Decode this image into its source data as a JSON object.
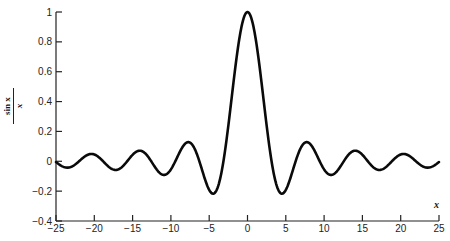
{
  "chart_data": {
    "type": "line",
    "title": "",
    "function": "sin(x)/x",
    "xlabel": "x",
    "ylabel_numerator": "sin x",
    "ylabel_denominator": "x",
    "xlim": [
      -25,
      25
    ],
    "ylim": [
      -0.4,
      1.0
    ],
    "grid": false,
    "legend": null,
    "x_ticks": [
      -25,
      -20,
      -15,
      -10,
      -5,
      0,
      5,
      10,
      15,
      20,
      25
    ],
    "x_tick_labels": [
      "−25",
      "−20",
      "−15",
      "−10",
      "−5",
      "0",
      "5",
      "10",
      "15",
      "20",
      "25"
    ],
    "y_ticks": [
      1,
      0.8,
      0.6,
      0.4,
      0.2,
      0,
      -0.2,
      -0.4
    ],
    "y_tick_labels": [
      "1",
      "0.8",
      "0.6",
      "0.4",
      "0.2",
      "0",
      "−0.2",
      "−0.4"
    ],
    "series": [
      {
        "name": "sin x / x",
        "color": "#0a0a0a",
        "x": [
          -25,
          -24,
          -23,
          -22,
          -21,
          -20,
          -19,
          -18,
          -17,
          -16,
          -15,
          -14,
          -13,
          -12,
          -11,
          -10,
          -9,
          -8,
          -7,
          -6,
          -5,
          -4,
          -3,
          -2,
          -1,
          0,
          1,
          2,
          3,
          4,
          5,
          6,
          7,
          8,
          9,
          10,
          11,
          12,
          13,
          14,
          15,
          16,
          17,
          18,
          19,
          20,
          21,
          22,
          23,
          24,
          25
        ],
        "values": [
          -0.005,
          -0.038,
          -0.037,
          0.0,
          0.04,
          0.046,
          0.008,
          -0.042,
          -0.056,
          -0.018,
          0.043,
          0.071,
          0.032,
          -0.045,
          -0.091,
          -0.054,
          0.046,
          0.124,
          0.094,
          -0.047,
          -0.192,
          -0.189,
          0.047,
          0.455,
          0.841,
          1.0,
          0.841,
          0.455,
          0.047,
          -0.189,
          -0.192,
          -0.047,
          0.094,
          0.124,
          0.046,
          -0.054,
          -0.091,
          -0.045,
          0.032,
          0.071,
          0.043,
          -0.018,
          -0.056,
          -0.042,
          0.008,
          0.046,
          0.04,
          0.0,
          -0.037,
          -0.038,
          -0.005
        ]
      }
    ]
  },
  "axes": {
    "x_label": "x",
    "y_label_num": "sin x",
    "y_label_den": "x"
  }
}
